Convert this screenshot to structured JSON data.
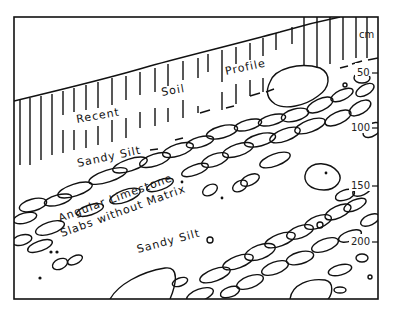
{
  "diagram": {
    "type": "stratigraphic-section",
    "scale": {
      "unit": "cm",
      "ticks": [
        {
          "label": "50",
          "y": 73
        },
        {
          "label": "100",
          "y": 128
        },
        {
          "label": "150",
          "y": 186
        },
        {
          "label": "200",
          "y": 242
        }
      ]
    },
    "labels": {
      "recent": "Recent",
      "soil": "Soil",
      "profile": "Profile",
      "sandy_silt_upper": "Sandy Silt",
      "angular_limestone": "Angular Limestone",
      "slabs_without_matrix": "Slabs without Matrix",
      "sandy_silt_lower": "Sandy Silt"
    },
    "layers": [
      "Recent Soil Profile",
      "Sandy Silt",
      "Angular Limestone Slabs without Matrix",
      "Sandy Silt",
      "Limestone slabs (lower)"
    ]
  }
}
